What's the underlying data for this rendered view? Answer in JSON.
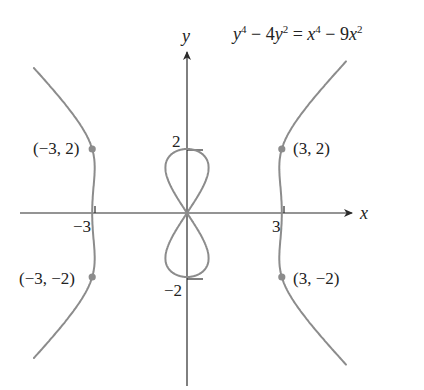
{
  "equation": {
    "lhs_var1": "y",
    "lhs_pow1": "4",
    "lhs_mid": " − 4",
    "lhs_var2": "y",
    "lhs_pow2": "2",
    "eq": " = ",
    "rhs_var1": "x",
    "rhs_pow1": "4",
    "rhs_mid": " − 9",
    "rhs_var2": "x",
    "rhs_pow2": "2"
  },
  "axes": {
    "x_label": "x",
    "y_label": "y",
    "x_ticks": [
      {
        "value": -3,
        "label": "−3"
      },
      {
        "value": 3,
        "label": "3"
      }
    ],
    "y_ticks": [
      {
        "value": 2,
        "label": "2"
      },
      {
        "value": -2,
        "label": "−2"
      }
    ]
  },
  "points": [
    {
      "x": -3,
      "y": 2,
      "label": "(−3, 2)"
    },
    {
      "x": 3,
      "y": 2,
      "label": "(3, 2)"
    },
    {
      "x": -3,
      "y": -2,
      "label": "(−3, −2)"
    },
    {
      "x": 3,
      "y": -2,
      "label": "(3, −2)"
    }
  ],
  "colors": {
    "curve": "#8c8c8c",
    "axis": "#2a2a2a",
    "point": "#8c8c8c",
    "background": "#ffffff"
  },
  "chart_data": {
    "type": "line",
    "xlabel": "x",
    "ylabel": "y",
    "equation": "y^4 - 4y^2 = x^4 - 9x^2",
    "xlim": [
      -5.2,
      5.0
    ],
    "ylim": [
      -5.3,
      5.0
    ],
    "grid": false,
    "labeled_ticks": {
      "x": [
        -3,
        3
      ],
      "y": [
        2,
        -2
      ]
    },
    "highlighted_points": [
      [
        -3,
        2
      ],
      [
        3,
        2
      ],
      [
        -3,
        -2
      ],
      [
        3,
        -2
      ]
    ],
    "components": [
      {
        "name": "left branch",
        "x_range": [
          -4.8,
          -2.93
        ]
      },
      {
        "name": "right branch",
        "x_range": [
          2.93,
          4.9
        ]
      },
      {
        "name": "figure-eight loop",
        "x_range": [
          -0.68,
          0.68
        ],
        "y_range": [
          -2,
          2
        ]
      }
    ]
  }
}
